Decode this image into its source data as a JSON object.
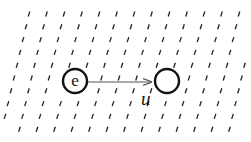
{
  "diagram": {
    "particle": {
      "label": "e",
      "cx": 75,
      "cy": 81,
      "r": 12
    },
    "target": {
      "label": "",
      "cx": 167,
      "cy": 81,
      "r": 12
    },
    "arrow": {
      "label": "u",
      "x1": 88,
      "y1": 82,
      "x2": 151,
      "y2": 82
    },
    "field": {
      "rows": 10,
      "row_start_y": 14,
      "row_spacing": 12.8,
      "col_spacing": 17.5,
      "row_shift": -3,
      "dash_dx": 1.6,
      "dash_dy": 5
    },
    "colors": {
      "stroke": "#111111",
      "field": "#222222",
      "arrow": "#555555",
      "background": "#ffffff"
    }
  }
}
